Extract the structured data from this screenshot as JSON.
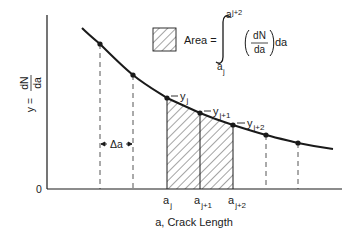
{
  "diagram": {
    "y_axis_label": {
      "prefix": "y =",
      "numerator": "dN",
      "denominator": "da"
    },
    "x_axis_label": "a, Crack Length",
    "origin_label": "0",
    "delta_label": "Δa",
    "legend": {
      "area_text": "Area =",
      "integral_upper": "a",
      "integral_upper_sub": "j+2",
      "integral_lower": "a",
      "integral_lower_sub": "j",
      "numerator": "dN",
      "denominator": "da",
      "trailing": "da"
    },
    "curve_points": [
      {
        "x": 100,
        "y": 44
      },
      {
        "x": 133,
        "y": 75
      },
      {
        "x": 167,
        "y": 98
      },
      {
        "x": 200,
        "y": 113
      },
      {
        "x": 233,
        "y": 125
      },
      {
        "x": 266,
        "y": 135
      },
      {
        "x": 298,
        "y": 143
      }
    ],
    "y_labels": [
      {
        "base": "y",
        "sub": "j"
      },
      {
        "base": "y",
        "sub": "j+1"
      },
      {
        "base": "y",
        "sub": "j+2"
      }
    ],
    "x_labels": [
      {
        "base": "a",
        "sub": "j"
      },
      {
        "base": "a",
        "sub": "j+1"
      },
      {
        "base": "a",
        "sub": "j+2"
      }
    ],
    "colors": {
      "ink": "#1a1a1a",
      "dash": "#555555"
    }
  }
}
